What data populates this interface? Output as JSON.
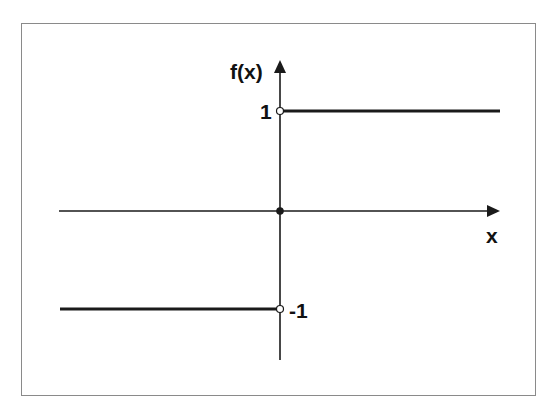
{
  "figure": {
    "y_axis_label": "f(x)",
    "x_axis_label": "x",
    "tick_labels": {
      "upper": "1",
      "lower": "-1"
    },
    "colors": {
      "line": "#1a1a1a",
      "frame": "#8a8a8a",
      "background": "#ffffff"
    },
    "pieces": [
      {
        "domain": "x < 0",
        "value": -1,
        "endpoint": "open circle at (0,-1)"
      },
      {
        "domain": "x = 0",
        "value": 0,
        "endpoint": "filled dot at origin"
      },
      {
        "domain": "x > 0",
        "value": 1,
        "endpoint": "open circle at (0,1)"
      }
    ]
  }
}
